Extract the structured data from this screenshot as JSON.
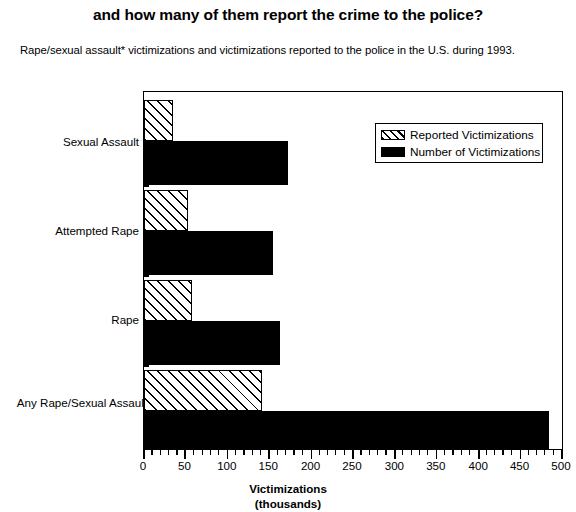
{
  "header": {
    "title": "and how many of them report the crime to the police?",
    "subtitle": "Rape/sexual assault* victimizations and victimizations reported to the police in the U.S. during 1993."
  },
  "legend": {
    "items": [
      {
        "label": "Reported Victimizations",
        "swatch": "hatched-diagonal",
        "color": "#000000"
      },
      {
        "label": "Number of Victimizations",
        "swatch": "solid-black",
        "color": "#000000"
      }
    ],
    "position": "inside-top-right"
  },
  "chart_data": {
    "type": "bar",
    "orientation": "horizontal",
    "title": "and how many of them report the crime to the police?",
    "subtitle": "Rape/sexual assault* victimizations and victimizations reported to the police in the U.S. during 1993.",
    "categories": [
      "Sexual Assault",
      "Attempted Rape",
      "Rape",
      "Any Rape/Sexual Assault"
    ],
    "series": [
      {
        "name": "Reported Victimizations",
        "values": [
          35,
          53,
          58,
          142
        ]
      },
      {
        "name": "Number of Victimizations",
        "values": [
          173,
          154,
          163,
          485
        ]
      }
    ],
    "xlabel": "Victimizations",
    "xlabel_sub": "(thousands)",
    "ylabel": "",
    "xlim": [
      0,
      500
    ],
    "xticks": [
      0,
      50,
      100,
      150,
      200,
      250,
      300,
      350,
      400,
      450,
      500
    ],
    "xtick_labels": [
      "0",
      "50",
      "100",
      "150",
      "200",
      "250",
      "300",
      "350",
      "400",
      "450",
      "500"
    ],
    "minor_tick_step": 10,
    "grid": false
  },
  "axis": {
    "x_title_line1": "Victimizations",
    "x_title_line2": "(thousands)"
  }
}
